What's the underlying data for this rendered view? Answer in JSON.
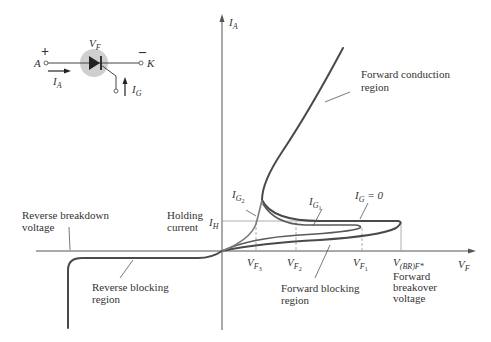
{
  "symbol": {
    "voltage_label": "V",
    "voltage_sub": "F",
    "anode_label": "A",
    "cathode_label": "K",
    "plus": "+",
    "minus": "–",
    "anode_current": "I",
    "anode_current_sub": "A",
    "gate_current": "I",
    "gate_current_sub": "G"
  },
  "axes": {
    "y_label": "I",
    "y_sub": "A",
    "x_label": "V",
    "x_sub": "F"
  },
  "annotations": {
    "forward_conduction": [
      "Forward conduction",
      "region"
    ],
    "reverse_breakdown": [
      "Reverse breakdown",
      "voltage"
    ],
    "holding_current": [
      "Holding",
      "current"
    ],
    "holding_symbol": "I",
    "holding_sub": "H",
    "reverse_blocking": [
      "Reverse blocking",
      "region"
    ],
    "forward_blocking": [
      "Forward blocking",
      "region"
    ],
    "forward_breakover": [
      "Forward",
      "breakover",
      "voltage"
    ],
    "ig2": "I",
    "ig2_sub": "G",
    "ig2_subsub": "2",
    "ig1": "I",
    "ig1_sub": "G",
    "ig1_subsub": "1",
    "ig0": "I",
    "ig0_sub": "G",
    "ig0_eq": " = 0"
  },
  "ticks": {
    "vf3": {
      "v": "V",
      "s": "F",
      "n": "3"
    },
    "vf2": {
      "v": "V",
      "s": "F",
      "n": "2"
    },
    "vf1": {
      "v": "V",
      "s": "F",
      "n": "1"
    },
    "vbr": {
      "v": "V",
      "s": "(BR)F*"
    }
  },
  "colors": {
    "curve": "#4a4a4a",
    "curve_light": "#7a7a7a",
    "axis": "#555555",
    "guide": "#999999",
    "symbol_circle": "#cfcfcf"
  }
}
